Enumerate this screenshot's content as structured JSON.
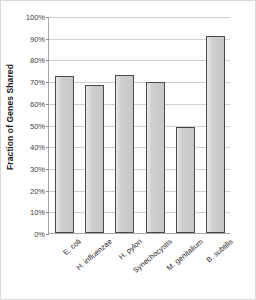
{
  "chart_data": {
    "type": "bar",
    "title": "",
    "xlabel": "",
    "ylabel": "Fraction of Genes Shared",
    "categories": [
      "E. coli",
      "H. influenzae",
      "H. pylori",
      "Synechocystis",
      "M. genitalium",
      "B. subtilis"
    ],
    "values": [
      72.5,
      68,
      73,
      69.5,
      49,
      91
    ],
    "value_unit": "%",
    "ylim": [
      0,
      100
    ],
    "ytick_values": [
      0,
      10,
      20,
      30,
      40,
      50,
      60,
      70,
      80,
      90,
      100
    ],
    "ytick_labels": [
      "0%",
      "10%",
      "20%",
      "30%",
      "40%",
      "50%",
      "60%",
      "70%",
      "80%",
      "90%",
      "100%"
    ],
    "grid": true,
    "legend": null,
    "bar_fill_color": "#cdcdcd",
    "bar_border_color": "#4a4a4a",
    "gridline_color": "#cfcfcf",
    "axis_color": "#a8a8a8",
    "xtick_label_rotation_degrees": -40
  }
}
